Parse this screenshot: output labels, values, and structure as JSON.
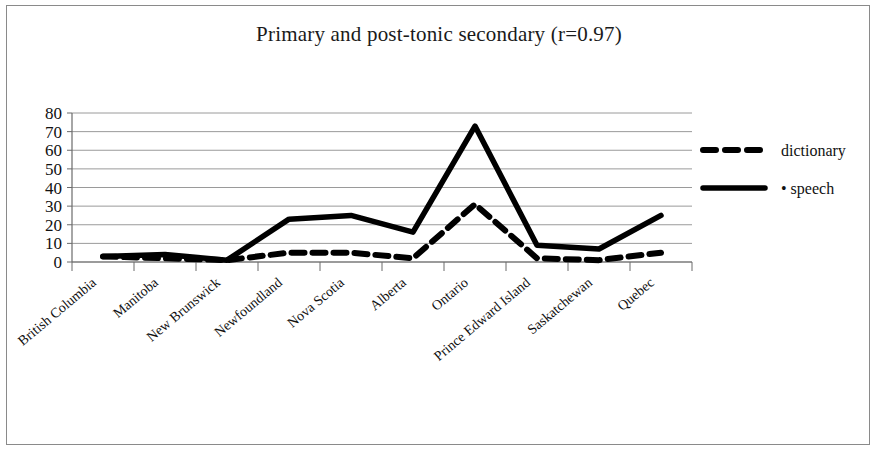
{
  "figure": {
    "border_color": "#8a8a8a",
    "background": "#ffffff"
  },
  "chart_data": {
    "type": "line",
    "title": "Primary and post-tonic secondary (r=0.97)",
    "xlabel": "",
    "ylabel": "",
    "ylim": [
      0,
      80
    ],
    "yticks": [
      0,
      10,
      20,
      30,
      40,
      50,
      60,
      70,
      80
    ],
    "grid": true,
    "legend_position": "right",
    "categories": [
      "British Columbia",
      "Manitoba",
      "New Brunswick",
      "Newfoundland",
      "Nova Scotia",
      "Alberta",
      "Ontario",
      "Prince Edward Island",
      "Saskatchewan",
      "Quebec"
    ],
    "series": [
      {
        "name": "dictionary",
        "style": "dashed",
        "color": "#000000",
        "values": [
          3,
          2,
          1,
          5,
          5,
          2,
          31,
          2,
          1,
          5
        ]
      },
      {
        "name": "speech",
        "style": "solid",
        "color": "#000000",
        "marker": "•",
        "values": [
          3,
          4,
          1,
          23,
          25,
          16,
          73,
          9,
          7,
          25
        ]
      }
    ]
  },
  "legend": {
    "entries": [
      {
        "label": "dictionary",
        "style": "dashed"
      },
      {
        "label": "• speech",
        "style": "solid"
      }
    ]
  },
  "axis": {
    "y_tick_labels": [
      "80",
      "70",
      "60",
      "50",
      "40",
      "30",
      "20",
      "10",
      "0"
    ],
    "x_tick_labels": [
      "British Columbia",
      "Manitoba",
      "New Brunswick",
      "Newfoundland",
      "Nova Scotia",
      "Alberta",
      "Ontario",
      "Prince Edward Island",
      "Saskatchewan",
      "Quebec"
    ]
  }
}
